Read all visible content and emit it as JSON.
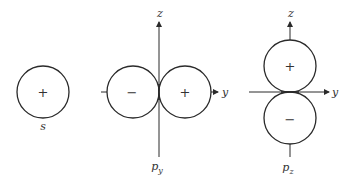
{
  "diagram": {
    "orbitals": [
      {
        "id": "s",
        "label": "s",
        "lobes": [
          {
            "sign": "+"
          }
        ]
      },
      {
        "id": "py",
        "label_main": "p",
        "label_sub": "y",
        "vertical_axis_label": "z",
        "horizontal_axis_label": "y",
        "lobes": [
          {
            "sign": "−",
            "side": "left"
          },
          {
            "sign": "+",
            "side": "right"
          }
        ]
      },
      {
        "id": "pz",
        "label_main": "p",
        "label_sub": "z",
        "vertical_axis_label": "z",
        "horizontal_axis_label": "y",
        "lobes": [
          {
            "sign": "+",
            "side": "top"
          },
          {
            "sign": "−",
            "side": "bottom"
          }
        ]
      }
    ]
  }
}
